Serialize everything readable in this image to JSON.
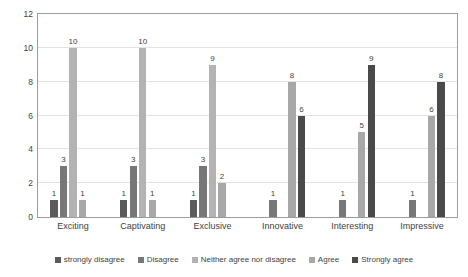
{
  "chart_data": {
    "type": "bar",
    "title": "",
    "subtitle": "",
    "xlabel": "",
    "ylabel": "",
    "ylim": [
      0,
      12
    ],
    "yticks": [
      0,
      2,
      4,
      6,
      8,
      10,
      12
    ],
    "grid": true,
    "legend_position": "bottom",
    "categories": [
      "Exciting",
      "Captivating",
      "Exclusive",
      "Innovative",
      "Interesting",
      "Impressive"
    ],
    "series": [
      {
        "name": "strongly disagree",
        "color": "#5b5b5b",
        "values": [
          1,
          1,
          1,
          0,
          0,
          0
        ]
      },
      {
        "name": "Disagree",
        "color": "#777777",
        "values": [
          3,
          3,
          3,
          1,
          1,
          1
        ]
      },
      {
        "name": "Neither agree nor disagree",
        "color": "#b3b3b3",
        "values": [
          10,
          10,
          9,
          0,
          0,
          0
        ]
      },
      {
        "name": "Agree",
        "color": "#a8a8a8",
        "values": [
          1,
          1,
          2,
          8,
          5,
          6
        ]
      },
      {
        "name": "Strongly agree",
        "color": "#4a4a4a",
        "values": [
          0,
          0,
          0,
          6,
          9,
          8
        ]
      }
    ],
    "data_labels": [
      [
        "1",
        "3",
        "10",
        "1",
        ""
      ],
      [
        "1",
        "3",
        "10",
        "1",
        ""
      ],
      [
        "1",
        "3",
        "9",
        "2",
        ""
      ],
      [
        "",
        "1",
        "",
        "8",
        "6"
      ],
      [
        "",
        "1",
        "",
        "5",
        "9"
      ],
      [
        "",
        "1",
        "",
        "6",
        "8"
      ]
    ]
  },
  "axis": {
    "ytick_labels": [
      "12",
      "10",
      "8",
      "6",
      "4",
      "2",
      "0"
    ]
  },
  "legend": {
    "items": [
      {
        "label": "strongly disagree"
      },
      {
        "label": "Disagree"
      },
      {
        "label": "Neither agree nor disagree"
      },
      {
        "label": "Agree"
      },
      {
        "label": "Strongly agree"
      }
    ]
  },
  "colors": {
    "plot_border": "#9c9c9c",
    "gridline": "#e2e2e2",
    "text": "#3f3f3f",
    "background": "#ffffff"
  }
}
